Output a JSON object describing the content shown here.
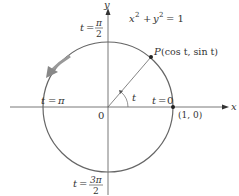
{
  "diagram": {
    "equation": {
      "lhs_x": "x",
      "lhs_y": "y",
      "exp": "2",
      "plus": "+",
      "rhs": "= 1"
    },
    "axes": {
      "x_label": "x",
      "y_label": "y",
      "origin_label": "0"
    },
    "point_P": {
      "name": "P",
      "coords": "(cos t, sin t)"
    },
    "point_1_0": {
      "label": "(1, 0)"
    },
    "angle_label": "t",
    "t_labels": {
      "t0": {
        "t": "t",
        "eq": "=",
        "value": "0"
      },
      "t_pi": {
        "t": "t",
        "eq": "=",
        "value": "π"
      },
      "t_pi2": {
        "t": "t",
        "eq": "=",
        "num": "π",
        "den": "2"
      },
      "t_3pi2": {
        "t": "t",
        "eq": "=",
        "num": "3π",
        "den": "2"
      }
    },
    "colors": {
      "circle": "#666666",
      "axis": "#555555",
      "arrow": "#888888",
      "text": "#333333"
    }
  }
}
